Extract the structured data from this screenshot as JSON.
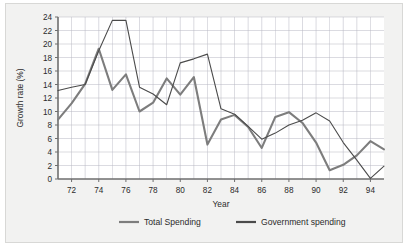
{
  "figure": {
    "background_color": "#f2f2f1",
    "border_color": "#d8d8d6",
    "plot_background_color": "#ffffff"
  },
  "chart_data": {
    "type": "line",
    "title": "",
    "xlabel": "Year",
    "ylabel": "Growth rate (%)",
    "xlim": [
      71,
      95
    ],
    "ylim": [
      0,
      24
    ],
    "ytick_step": 2,
    "yticks": [
      0,
      2,
      4,
      6,
      8,
      10,
      12,
      14,
      16,
      18,
      20,
      22,
      24
    ],
    "ytick_labels": [
      "0",
      "2",
      "4",
      "6",
      "8",
      "10",
      "12",
      "14",
      "16",
      "18",
      "20",
      "22",
      "24"
    ],
    "xticks": [
      72,
      74,
      76,
      78,
      80,
      82,
      84,
      86,
      88,
      90,
      92,
      94
    ],
    "xtick_labels": [
      "72",
      "74",
      "76",
      "78",
      "80",
      "82",
      "84",
      "86",
      "88",
      "90",
      "92",
      "94"
    ],
    "grid": true,
    "grid_color": "#b9b9c4",
    "legend_position": "bottom",
    "x": [
      71,
      72,
      73,
      74,
      75,
      76,
      77,
      78,
      79,
      80,
      81,
      82,
      83,
      84,
      85,
      86,
      87,
      88,
      89,
      90,
      91,
      92,
      93,
      94,
      95
    ],
    "series": [
      {
        "name": "Total Spending",
        "color": "#7d7d7d",
        "width": 2.1,
        "values": [
          8.8,
          11.2,
          14.1,
          19.3,
          13.2,
          15.5,
          10.0,
          11.3,
          14.9,
          12.5,
          15.1,
          5.1,
          8.8,
          9.5,
          7.7,
          4.6,
          9.2,
          9.9,
          8.3,
          5.4,
          1.3,
          2.1,
          3.5,
          5.6,
          4.4
        ]
      },
      {
        "name": "Government spending",
        "color": "#4b4b4b",
        "width": 1.1,
        "values": [
          13.1,
          13.6,
          14.0,
          19.0,
          23.5,
          23.5,
          13.6,
          12.6,
          11.0,
          17.2,
          17.8,
          18.5,
          10.4,
          9.6,
          7.8,
          5.9,
          6.8,
          8.0,
          8.7,
          9.8,
          8.6,
          5.4,
          2.8,
          0.1,
          1.9
        ]
      }
    ]
  },
  "legend": {
    "items": [
      {
        "label": "Total Spending",
        "color": "#7d7d7d"
      },
      {
        "label": "Government spending",
        "color": "#4b4b4b"
      }
    ]
  }
}
